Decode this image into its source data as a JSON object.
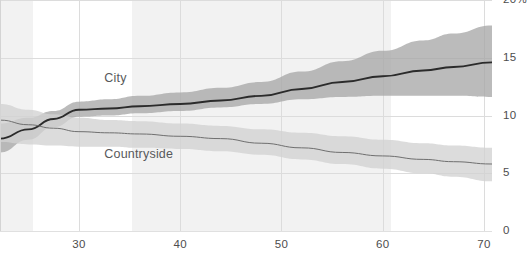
{
  "chart_data": {
    "type": "line",
    "title": "",
    "subtitle": "",
    "xlabel": "",
    "ylabel": "",
    "xlim": [
      22.2,
      70.8
    ],
    "ylim": [
      0,
      20
    ],
    "grid": true,
    "legend_position": "inline-annotation",
    "x_ticks": [
      30,
      40,
      50,
      60,
      70
    ],
    "x_tick_labels": [
      "30",
      "40",
      "50",
      "60",
      "70"
    ],
    "y_ticks": [
      0,
      5,
      10,
      15,
      20
    ],
    "y_tick_labels": [
      "0",
      "5",
      "10",
      "15",
      "20%"
    ],
    "y_axis_side": "right",
    "background_bands": [
      {
        "x_start": 22.2,
        "x_end": 25.5,
        "color": "#f2f2f2"
      },
      {
        "x_start": 35.2,
        "x_end": 60.8,
        "color": "#f2f2f2"
      }
    ],
    "series": [
      {
        "name": "City",
        "label": "City",
        "line_color": "#2b2b2b",
        "band_color": "#a8a8a8",
        "x": [
          22.2,
          25,
          27.5,
          30,
          33,
          36,
          40,
          44,
          48,
          52,
          56,
          60,
          64,
          67,
          70.8
        ],
        "values": [
          8.0,
          8.8,
          9.7,
          10.5,
          10.6,
          10.8,
          11.0,
          11.3,
          11.7,
          12.3,
          12.9,
          13.4,
          13.9,
          14.2,
          14.6
        ],
        "band_lower": [
          6.8,
          7.9,
          9.0,
          9.9,
          10.0,
          10.2,
          10.4,
          10.7,
          11.0,
          11.4,
          11.6,
          11.7,
          11.7,
          11.7,
          11.6
        ],
        "band_upper": [
          9.3,
          9.8,
          10.4,
          11.2,
          11.4,
          11.7,
          12.0,
          12.4,
          12.9,
          13.8,
          14.7,
          15.6,
          16.5,
          17.1,
          17.8
        ]
      },
      {
        "name": "Countryside",
        "label": "Countryside",
        "line_color": "#6f6f6f",
        "band_color": "#d2d2d2",
        "x": [
          22.2,
          25,
          27.5,
          30,
          33,
          36,
          40,
          44,
          48,
          52,
          56,
          60,
          64,
          67,
          70.8
        ],
        "values": [
          9.6,
          9.2,
          8.9,
          8.6,
          8.5,
          8.4,
          8.2,
          8.0,
          7.6,
          7.2,
          6.8,
          6.5,
          6.2,
          6.0,
          5.8
        ],
        "band_lower": [
          7.7,
          7.5,
          7.4,
          7.3,
          7.3,
          7.2,
          7.1,
          6.9,
          6.6,
          6.2,
          5.8,
          5.4,
          5.0,
          4.7,
          4.3
        ],
        "band_upper": [
          11.0,
          10.5,
          10.1,
          9.8,
          9.6,
          9.5,
          9.3,
          9.1,
          8.8,
          8.5,
          8.2,
          7.9,
          7.6,
          7.4,
          7.2
        ]
      }
    ],
    "annotations": [
      {
        "text": "City",
        "x": 32.5,
        "y": 13.2
      },
      {
        "text": "Countryside",
        "x": 32.5,
        "y": 6.6
      }
    ]
  },
  "colors": {
    "grid": "#dcdcdc",
    "band_background": "#f2f2f2",
    "tick_text": "#4d4d4d",
    "annotation_text": "#58595b"
  }
}
